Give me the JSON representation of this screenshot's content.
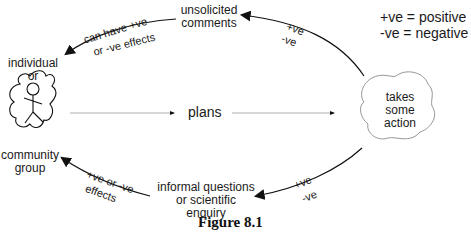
{
  "legend": {
    "positive": "+ve = positive",
    "negative": "-ve = negative"
  },
  "nodes": {
    "individual": {
      "line1": "individual",
      "line2": "or"
    },
    "community": {
      "line1": "community",
      "line2": "group"
    },
    "plans": "plans",
    "action": {
      "line1": "takes",
      "line2": "some",
      "line3": "action"
    },
    "comments": {
      "line1": "unsolicited",
      "line2": "comments"
    },
    "questions": {
      "line1": "informal questions",
      "line2": "or scientific",
      "line3": "enquiry"
    }
  },
  "edge_labels": {
    "top_left": {
      "line1": "can have +ve",
      "line2": "or -ve effects"
    },
    "top_right": {
      "line1": "+ve",
      "line2": "-ve"
    },
    "bottom_left": {
      "line1": "+ve or -ve",
      "line2": "effects"
    },
    "bottom_right": {
      "line1": "+ve",
      "line2": "-ve"
    }
  },
  "caption": "Figure 8.1",
  "colors": {
    "stroke": "#111111",
    "thin_stroke": "#8a8a8a",
    "text": "#1a1a1a"
  }
}
